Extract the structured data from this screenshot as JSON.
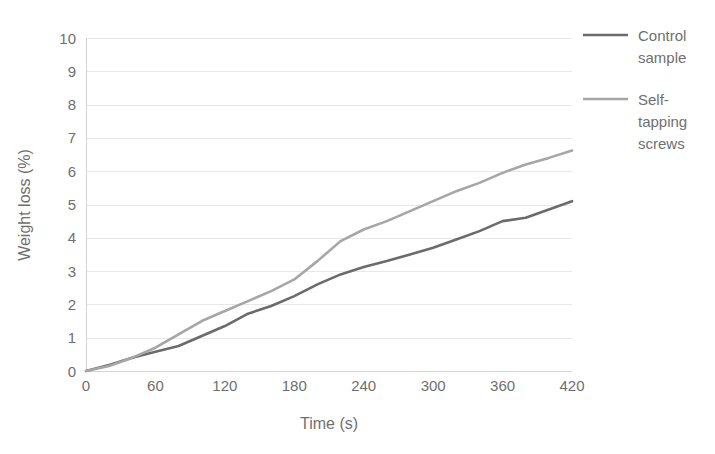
{
  "chart_data": {
    "type": "line",
    "title": "",
    "xlabel": "Time (s)",
    "ylabel": "Weight loss (%)",
    "xlim": [
      0,
      420
    ],
    "ylim": [
      0,
      10
    ],
    "grid": true,
    "legend_position": "right",
    "xticks": [
      "0",
      "60",
      "120",
      "180",
      "240",
      "300",
      "360",
      "420"
    ],
    "yticks": [
      "0",
      "1",
      "2",
      "3",
      "4",
      "5",
      "6",
      "7",
      "8",
      "9",
      "10"
    ],
    "x": [
      0,
      20,
      40,
      60,
      80,
      100,
      120,
      140,
      160,
      180,
      200,
      220,
      240,
      260,
      280,
      300,
      320,
      340,
      360,
      380,
      400,
      420
    ],
    "series": [
      {
        "name": "Control sample",
        "color": "#6b6b6b",
        "values": [
          0.0,
          0.18,
          0.4,
          0.58,
          0.75,
          1.05,
          1.35,
          1.72,
          1.95,
          2.25,
          2.6,
          2.9,
          3.12,
          3.3,
          3.5,
          3.7,
          3.95,
          4.2,
          4.5,
          4.6,
          4.85,
          5.1
        ]
      },
      {
        "name": "Self-tapping screws",
        "color": "#a6a6a6",
        "values": [
          0.0,
          0.15,
          0.4,
          0.7,
          1.1,
          1.5,
          1.8,
          2.1,
          2.4,
          2.75,
          3.3,
          3.9,
          4.25,
          4.5,
          4.8,
          5.1,
          5.4,
          5.65,
          5.95,
          6.2,
          6.4,
          6.62
        ]
      }
    ]
  },
  "legend": {
    "entries": [
      {
        "label_line_1": "Control",
        "label_line_2": "sample"
      },
      {
        "label_line_1": "Self-",
        "label_line_2": "tapping",
        "label_line_3": "screws"
      }
    ]
  },
  "colors": {
    "control": "#6b6b6b",
    "self_tapping": "#a6a6a6",
    "grid": "#e8e8e8",
    "axis": "#d4d4d4",
    "text": "#6f6f6f"
  }
}
